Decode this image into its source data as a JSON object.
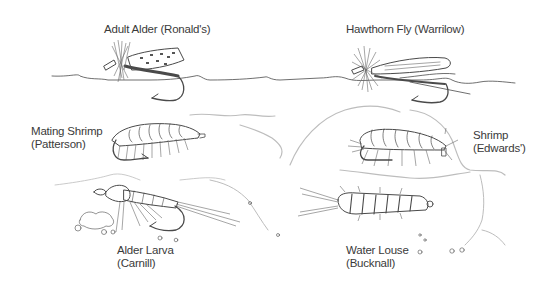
{
  "illustration": {
    "subject": "Fishing fly patterns drawn in pencil",
    "colors": {
      "ink": "#4a4a4a",
      "faint": "#bdbdbd",
      "label": "#3a3a3a",
      "background": "#ffffff"
    },
    "flies": [
      {
        "id": "adult-alder",
        "name": "Adult Alder",
        "tyer": "(Ronald's)",
        "label_lines": [
          "Adult Alder (Ronald's)"
        ]
      },
      {
        "id": "hawthorn-fly",
        "name": "Hawthorn Fly",
        "tyer": "(Warrilow)",
        "label_lines": [
          "Hawthorn Fly (Warrilow)"
        ]
      },
      {
        "id": "mating-shrimp",
        "name": "Mating Shrimp",
        "tyer": "(Patterson)",
        "label_lines": [
          "Mating Shrimp",
          "(Patterson)"
        ]
      },
      {
        "id": "shrimp",
        "name": "Shrimp",
        "tyer": "(Edwards')",
        "label_lines": [
          "Shrimp",
          "(Edwards')"
        ]
      },
      {
        "id": "alder-larva",
        "name": "Alder Larva",
        "tyer": "(Carnill)",
        "label_lines": [
          "Alder Larva",
          "(Carnill)"
        ]
      },
      {
        "id": "water-louse",
        "name": "Water Louse",
        "tyer": "(Bucknall)",
        "label_lines": [
          "Water Louse",
          "(Bucknall)"
        ]
      }
    ]
  }
}
